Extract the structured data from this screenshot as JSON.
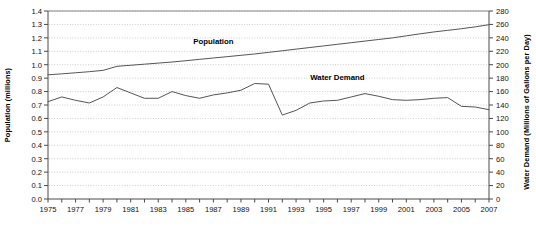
{
  "chart_data": {
    "type": "line",
    "title": "",
    "subtitle": "",
    "xlabel": "",
    "ylabel": "Population (millions)",
    "y2label": "Water Demand (Millions of Gallons per Day)",
    "grid": true,
    "legend_position": "inline-annotation",
    "x": [
      1975,
      1976,
      1977,
      1978,
      1979,
      1980,
      1981,
      1982,
      1983,
      1984,
      1985,
      1986,
      1987,
      1988,
      1989,
      1990,
      1991,
      1992,
      1993,
      1994,
      1995,
      1996,
      1997,
      1998,
      1999,
      2000,
      2001,
      2002,
      2003,
      2004,
      2005,
      2006,
      2007
    ],
    "xlim": [
      1975,
      2007
    ],
    "xtick_labels": [
      "1975",
      "1977",
      "1979",
      "1981",
      "1983",
      "1985",
      "1987",
      "1989",
      "1991",
      "1993",
      "1995",
      "1997",
      "1999",
      "2001",
      "2003",
      "2005",
      "2007"
    ],
    "xtick_values": [
      1975,
      1977,
      1979,
      1981,
      1983,
      1985,
      1987,
      1989,
      1991,
      1993,
      1995,
      1997,
      1999,
      2001,
      2003,
      2005,
      2007
    ],
    "ylim": [
      0.0,
      1.4
    ],
    "ytick_labels": [
      "0.0",
      "0.1",
      "0.2",
      "0.3",
      "0.4",
      "0.5",
      "0.6",
      "0.7",
      "0.8",
      "0.9",
      "1.0",
      "1.1",
      "1.2",
      "1.3",
      "1.4"
    ],
    "ytick_values": [
      0.0,
      0.1,
      0.2,
      0.3,
      0.4,
      0.5,
      0.6,
      0.7,
      0.8,
      0.9,
      1.0,
      1.1,
      1.2,
      1.3,
      1.4
    ],
    "y2lim": [
      0,
      280
    ],
    "y2tick_labels": [
      "0",
      "20",
      "40",
      "60",
      "80",
      "100",
      "120",
      "140",
      "160",
      "180",
      "200",
      "220",
      "240",
      "260",
      "280"
    ],
    "y2tick_values": [
      0,
      20,
      40,
      60,
      80,
      100,
      120,
      140,
      160,
      180,
      200,
      220,
      240,
      260,
      280
    ],
    "series": [
      {
        "name": "Population",
        "axis": "left",
        "units": "millions",
        "annotation": "Population",
        "color": "#555555",
        "values": [
          0.925,
          0.932,
          0.94,
          0.948,
          0.958,
          0.988,
          0.996,
          1.004,
          1.012,
          1.02,
          1.03,
          1.04,
          1.05,
          1.06,
          1.07,
          1.08,
          1.092,
          1.104,
          1.116,
          1.128,
          1.14,
          1.152,
          1.164,
          1.176,
          1.188,
          1.2,
          1.215,
          1.23,
          1.244,
          1.256,
          1.268,
          1.282,
          1.298
        ]
      },
      {
        "name": "Water Demand",
        "axis": "right",
        "units": "Millions of Gallons per Day",
        "annotation": "Water Demand",
        "color": "#555555",
        "values": [
          145,
          152,
          147,
          143,
          152,
          166,
          158,
          150,
          150,
          160,
          154,
          150,
          155,
          158,
          162,
          172,
          171,
          125,
          132,
          143,
          146,
          147,
          152,
          157,
          153,
          148,
          147,
          148,
          150,
          151,
          138,
          137,
          133
        ]
      }
    ],
    "annotations": [
      {
        "text": "Population",
        "x": 1987,
        "y_left": 1.155
      },
      {
        "text": "Water Demand",
        "x": 1996,
        "y_left": 0.885
      }
    ]
  }
}
